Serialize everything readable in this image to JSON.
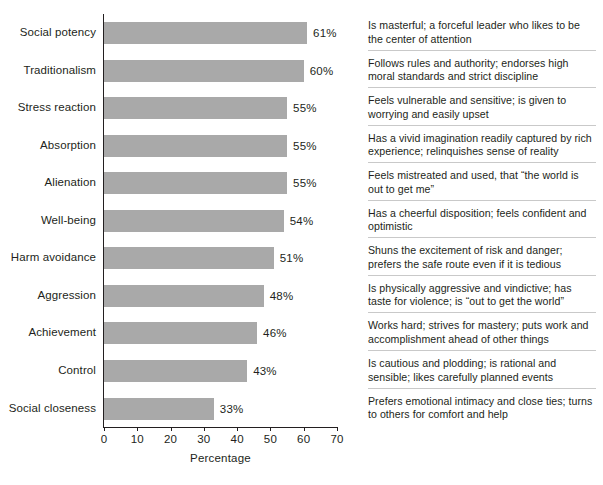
{
  "chart_data": {
    "type": "bar",
    "orientation": "horizontal",
    "title": "",
    "xlabel": "Percentage",
    "ylabel": "",
    "xlim": [
      0,
      70
    ],
    "xticks": [
      0,
      10,
      20,
      30,
      40,
      50,
      60,
      70
    ],
    "xtick_labels": [
      "0",
      "10",
      "20",
      "30",
      "40",
      "50",
      "60",
      "70"
    ],
    "grid": false,
    "legend": "none",
    "bar_color": "#a9a9a9",
    "axis_color": "#231f20",
    "categories": [
      "Social potency",
      "Traditionalism",
      "Stress reaction",
      "Absorption",
      "Alienation",
      "Well-being",
      "Harm avoidance",
      "Aggression",
      "Achievement",
      "Control",
      "Social closeness"
    ],
    "values": [
      61,
      60,
      55,
      55,
      55,
      54,
      51,
      48,
      46,
      43,
      33
    ],
    "value_labels": [
      "61%",
      "60%",
      "55%",
      "55%",
      "55%",
      "54%",
      "51%",
      "48%",
      "46%",
      "43%",
      "33%"
    ],
    "annotations": [
      "Is masterful; a forceful leader who likes to be the center of attention",
      "Follows rules and authority; endorses high moral standards and strict discipline",
      "Feels vulnerable and sensitive; is given to worrying and easily upset",
      "Has a vivid imagination readily captured by rich experience; relinquishes sense of reality",
      "Feels mistreated and used, that “the world is out to get me”",
      "Has a cheerful disposition; feels confident and optimistic",
      "Shuns the excitement of risk and danger; prefers the safe route even if it is tedious",
      "Is physically aggressive and vindictive; has taste for violence; is “out to get the world”",
      "Works hard; strives for mastery; puts work and accomplishment ahead of other things",
      "Is cautious and plodding; is rational and sensible; likes carefully planned events",
      "Prefers emotional intimacy and close ties; turns to others for comfort and help"
    ]
  }
}
